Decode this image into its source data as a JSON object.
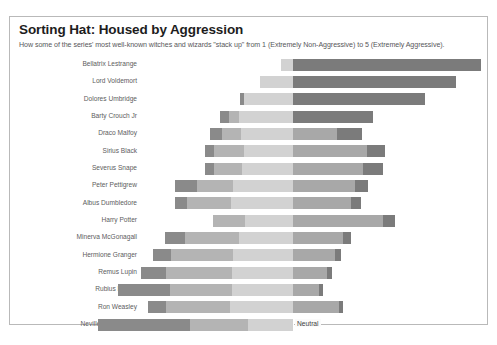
{
  "header": {
    "title": "Sorting Hat: Housed by Aggression",
    "subtitle": "How some of the series' most well-known witches and wizards \"stack up\" from 1 (Extremely Non-Aggressive) to 5 (Extremely Aggressive)."
  },
  "annotations": {
    "neutral_label": "Neutral"
  },
  "footer": {
    "caption": ""
  },
  "colors": {
    "level1": "#8a8a8a",
    "level2": "#b4b4b4",
    "level3": "#d2d2d2",
    "level4": "#a8a8a8",
    "level5": "#7b7b7b",
    "panel_border": "#b9b9b9",
    "title": "#1d1d1d",
    "subtitle": "#57575a",
    "label": "#5d5d60",
    "center_line": "#ffffff"
  },
  "chart_data": {
    "type": "bar",
    "subtype": "diverging-stacked-bar",
    "title": "Sorting Hat: Housed by Aggression",
    "subtitle": "How some of the series' most well-known witches and wizards \"stack up\" from 1 (Extremely Non-Aggressive) to 5 (Extremely Aggressive).",
    "xlabel": "",
    "ylabel": "",
    "grid": false,
    "legend": "none",
    "scale_min": 1,
    "scale_max": 5,
    "center_reference": "Neutral",
    "levels": [
      {
        "value": 1,
        "name": "Extremely Non-Aggressive",
        "color": "#8a8a8a"
      },
      {
        "value": 2,
        "name": "Non-Aggressive",
        "color": "#b4b4b4"
      },
      {
        "value": 3,
        "name": "Neutral",
        "color": "#d2d2d2"
      },
      {
        "value": 4,
        "name": "Aggressive",
        "color": "#a8a8a8"
      },
      {
        "value": 5,
        "name": "Extremely Aggressive",
        "color": "#7b7b7b"
      }
    ],
    "categories": [
      "Bellatrix Lestrange",
      "Lord Voldemort",
      "Dolores Umbridge",
      "Barty Crouch Jr",
      "Draco Malfoy",
      "Sirius Black",
      "Severus Snape",
      "Peter Pettigrew",
      "Albus Dumbledore",
      "Harry Potter",
      "Minerva McGonagall",
      "Hermione Granger",
      "Remus Lupin",
      "Rubius Hagrid",
      "Ron Weasley",
      "Neville Longbottom"
    ],
    "series": [
      {
        "name": "1 (Extremely Non-Aggressive)",
        "values": [
          0,
          0,
          2,
          4,
          6,
          4,
          4,
          9,
          9,
          0,
          8,
          7,
          10,
          14,
          7,
          22
        ]
      },
      {
        "name": "2 (Non-Aggressive)",
        "values": [
          0,
          0,
          0,
          5,
          10,
          15,
          12,
          16,
          20,
          12,
          23,
          25,
          26,
          22,
          25,
          20
        ]
      },
      {
        "name": "3 (Neutral)",
        "values": [
          4,
          12,
          22,
          30,
          39,
          49,
          45,
          34,
          40,
          32,
          40,
          43,
          42,
          38,
          42,
          34
        ]
      },
      {
        "name": "4 (Aggressive)",
        "values": [
          0,
          0,
          0,
          0,
          0,
          0,
          0,
          22,
          20,
          38,
          18,
          20,
          12,
          12,
          14,
          0
        ]
      },
      {
        "name": "5 (Extremely Aggressive)",
        "values": [
          68,
          60,
          48,
          30,
          9,
          8,
          9,
          5,
          4,
          6,
          3,
          2,
          2,
          2,
          2,
          0
        ]
      }
    ],
    "bars": [
      {
        "label": "Bellatrix Lestrange",
        "neg_px": 12,
        "segments": [
          {
            "level": 3,
            "w": 12,
            "color": "#d2d2d2"
          },
          {
            "level": 5,
            "w": 188,
            "color": "#7b7b7b"
          }
        ]
      },
      {
        "label": "Lord Voldemort",
        "neg_px": 33,
        "segments": [
          {
            "level": 3,
            "w": 33,
            "color": "#d2d2d2"
          },
          {
            "level": 5,
            "w": 163,
            "color": "#7b7b7b"
          }
        ]
      },
      {
        "label": "Dolores Umbridge",
        "neg_px": 53,
        "segments": [
          {
            "level": 1,
            "w": 4,
            "color": "#8a8a8a"
          },
          {
            "level": 3,
            "w": 49,
            "color": "#d2d2d2"
          },
          {
            "level": 5,
            "w": 132,
            "color": "#7b7b7b"
          }
        ]
      },
      {
        "label": "Barty Crouch Jr",
        "neg_px": 73,
        "segments": [
          {
            "level": 1,
            "w": 9,
            "color": "#8a8a8a"
          },
          {
            "level": 2,
            "w": 10,
            "color": "#b4b4b4"
          },
          {
            "level": 3,
            "w": 54,
            "color": "#d2d2d2"
          },
          {
            "level": 5,
            "w": 80,
            "color": "#7b7b7b"
          }
        ]
      },
      {
        "label": "Draco Malfoy",
        "neg_px": 83,
        "segments": [
          {
            "level": 1,
            "w": 12,
            "color": "#8a8a8a"
          },
          {
            "level": 2,
            "w": 19,
            "color": "#b4b4b4"
          },
          {
            "level": 3,
            "w": 52,
            "color": "#d2d2d2"
          },
          {
            "level": 4,
            "w": 44,
            "color": "#a8a8a8"
          },
          {
            "level": 5,
            "w": 25,
            "color": "#7b7b7b"
          }
        ]
      },
      {
        "label": "Sirius Black",
        "neg_px": 88,
        "segments": [
          {
            "level": 1,
            "w": 9,
            "color": "#8a8a8a"
          },
          {
            "level": 2,
            "w": 30,
            "color": "#b4b4b4"
          },
          {
            "level": 3,
            "w": 49,
            "color": "#d2d2d2"
          },
          {
            "level": 4,
            "w": 74,
            "color": "#a8a8a8"
          },
          {
            "level": 5,
            "w": 18,
            "color": "#7b7b7b"
          }
        ]
      },
      {
        "label": "Severus Snape",
        "neg_px": 88,
        "segments": [
          {
            "level": 1,
            "w": 9,
            "color": "#8a8a8a"
          },
          {
            "level": 2,
            "w": 28,
            "color": "#b4b4b4"
          },
          {
            "level": 3,
            "w": 51,
            "color": "#d2d2d2"
          },
          {
            "level": 4,
            "w": 70,
            "color": "#a8a8a8"
          },
          {
            "level": 5,
            "w": 20,
            "color": "#7b7b7b"
          }
        ]
      },
      {
        "label": "Peter Pettigrew",
        "neg_px": 118,
        "segments": [
          {
            "level": 1,
            "w": 22,
            "color": "#8a8a8a"
          },
          {
            "level": 2,
            "w": 36,
            "color": "#b4b4b4"
          },
          {
            "level": 3,
            "w": 60,
            "color": "#d2d2d2"
          },
          {
            "level": 4,
            "w": 62,
            "color": "#a8a8a8"
          },
          {
            "level": 5,
            "w": 13,
            "color": "#7b7b7b"
          }
        ]
      },
      {
        "label": "Albus Dumbledore",
        "neg_px": 118,
        "segments": [
          {
            "level": 1,
            "w": 12,
            "color": "#8a8a8a"
          },
          {
            "level": 2,
            "w": 44,
            "color": "#b4b4b4"
          },
          {
            "level": 3,
            "w": 62,
            "color": "#d2d2d2"
          },
          {
            "level": 4,
            "w": 58,
            "color": "#a8a8a8"
          },
          {
            "level": 5,
            "w": 10,
            "color": "#7b7b7b"
          }
        ]
      },
      {
        "label": "Harry Potter",
        "neg_px": 80,
        "segments": [
          {
            "level": 2,
            "w": 32,
            "color": "#b4b4b4"
          },
          {
            "level": 3,
            "w": 48,
            "color": "#d2d2d2"
          },
          {
            "level": 4,
            "w": 90,
            "color": "#a8a8a8"
          },
          {
            "level": 5,
            "w": 12,
            "color": "#7b7b7b"
          }
        ]
      },
      {
        "label": "Minerva McGonagall",
        "neg_px": 128,
        "segments": [
          {
            "level": 1,
            "w": 20,
            "color": "#8a8a8a"
          },
          {
            "level": 2,
            "w": 54,
            "color": "#b4b4b4"
          },
          {
            "level": 3,
            "w": 54,
            "color": "#d2d2d2"
          },
          {
            "level": 4,
            "w": 50,
            "color": "#a8a8a8"
          },
          {
            "level": 5,
            "w": 8,
            "color": "#7b7b7b"
          }
        ]
      },
      {
        "label": "Hermione Granger",
        "neg_px": 140,
        "segments": [
          {
            "level": 1,
            "w": 18,
            "color": "#8a8a8a"
          },
          {
            "level": 2,
            "w": 62,
            "color": "#b4b4b4"
          },
          {
            "level": 3,
            "w": 60,
            "color": "#d2d2d2"
          },
          {
            "level": 4,
            "w": 42,
            "color": "#a8a8a8"
          },
          {
            "level": 5,
            "w": 6,
            "color": "#7b7b7b"
          }
        ]
      },
      {
        "label": "Remus Lupin",
        "neg_px": 152,
        "segments": [
          {
            "level": 1,
            "w": 25,
            "color": "#8a8a8a"
          },
          {
            "level": 2,
            "w": 66,
            "color": "#b4b4b4"
          },
          {
            "level": 3,
            "w": 61,
            "color": "#d2d2d2"
          },
          {
            "level": 4,
            "w": 34,
            "color": "#a8a8a8"
          },
          {
            "level": 5,
            "w": 5,
            "color": "#7b7b7b"
          }
        ]
      },
      {
        "label": "Rubius Hagrid",
        "neg_px": 175,
        "segments": [
          {
            "level": 1,
            "w": 52,
            "color": "#8a8a8a"
          },
          {
            "level": 2,
            "w": 62,
            "color": "#b4b4b4"
          },
          {
            "level": 3,
            "w": 61,
            "color": "#d2d2d2"
          },
          {
            "level": 4,
            "w": 26,
            "color": "#a8a8a8"
          },
          {
            "level": 5,
            "w": 4,
            "color": "#7b7b7b"
          }
        ]
      },
      {
        "label": "Ron Weasley",
        "neg_px": 145,
        "segments": [
          {
            "level": 1,
            "w": 18,
            "color": "#8a8a8a"
          },
          {
            "level": 2,
            "w": 64,
            "color": "#b4b4b4"
          },
          {
            "level": 3,
            "w": 63,
            "color": "#d2d2d2"
          },
          {
            "level": 4,
            "w": 46,
            "color": "#a8a8a8"
          },
          {
            "level": 5,
            "w": 4,
            "color": "#7b7b7b"
          }
        ]
      },
      {
        "label": "Neville Longbottom",
        "neg_px": 195,
        "segments": [
          {
            "level": 1,
            "w": 92,
            "color": "#8a8a8a"
          },
          {
            "level": 2,
            "w": 58,
            "color": "#b4b4b4"
          },
          {
            "level": 3,
            "w": 45,
            "color": "#d2d2d2"
          }
        ]
      }
    ]
  }
}
